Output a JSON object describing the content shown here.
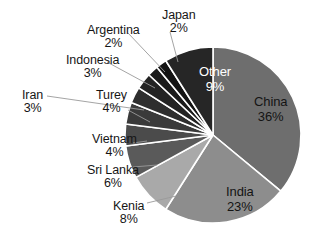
{
  "chart_data": {
    "type": "pie",
    "title": "",
    "subtitle": "",
    "xlabel": "",
    "ylabel": "",
    "legend_position": "none",
    "grid": false,
    "value_unit": "%",
    "total": 100,
    "start_angle_deg": 0,
    "direction": "clockwise",
    "background_color": "#ffffff",
    "categories": [
      "China",
      "India",
      "Kenia",
      "Sri Lanka",
      "Vietnam",
      "Turey",
      "Iran",
      "Indonesia",
      "Argentina",
      "Japan",
      "Other"
    ],
    "values": [
      36,
      23,
      8,
      6,
      4,
      4,
      3,
      3,
      2,
      2,
      9
    ],
    "slices": [
      {
        "name": "China",
        "value": 36,
        "label": "China",
        "value_label": "36%",
        "color": "#6e6e6e",
        "label_placement": "inside",
        "label_text_color": "#141414",
        "label_x": 254,
        "label_y": 95
      },
      {
        "name": "India",
        "value": 23,
        "label": "India",
        "value_label": "23%",
        "color": "#8d8d8d",
        "label_placement": "inside",
        "label_text_color": "#141414",
        "label_x": 226,
        "label_y": 185
      },
      {
        "name": "Kenia",
        "value": 8,
        "label": "Kenia",
        "value_label": "8%",
        "color": "#a9a9a9",
        "label_placement": "outside",
        "label_text_color": "#161616",
        "label_x": 113,
        "label_y": 200,
        "leader": [
          [
            147,
            203
          ],
          [
            176,
            196
          ]
        ]
      },
      {
        "name": "Sri Lanka",
        "value": 6,
        "label": "Sri Lanka",
        "value_label": "6%",
        "color": "#5a5a5a",
        "label_placement": "outside",
        "label_text_color": "#161616",
        "label_x": 87,
        "label_y": 164,
        "leader": [
          [
            133,
            167
          ],
          [
            157,
            165
          ]
        ]
      },
      {
        "name": "Vietnam",
        "value": 4,
        "label": "Vietnam",
        "value_label": "4%",
        "color": "#4b4b4b",
        "label_placement": "outside",
        "label_text_color": "#161616",
        "label_x": 92,
        "label_y": 133,
        "leader": [
          [
            133,
            143
          ],
          [
            147,
            141
          ]
        ]
      },
      {
        "name": "Turey",
        "value": 4,
        "label": "Turey",
        "value_label": "4%",
        "color": "#3a3a3a",
        "label_placement": "outside",
        "label_text_color": "#161616",
        "label_x": 96,
        "label_y": 89,
        "leader": [
          [
            128,
            110
          ],
          [
            150,
            122
          ]
        ]
      },
      {
        "name": "Iran",
        "value": 3,
        "label": "Iran",
        "value_label": "3%",
        "color": "#2e2e2e",
        "label_placement": "outside",
        "label_text_color": "#161616",
        "label_x": 22,
        "label_y": 89,
        "leader": [
          [
            47,
            96
          ],
          [
            144,
            110
          ]
        ]
      },
      {
        "name": "Indonesia",
        "value": 3,
        "label": "Indonesia",
        "value_label": "3%",
        "color": "#232323",
        "label_placement": "outside",
        "label_text_color": "#161616",
        "label_x": 66,
        "label_y": 54,
        "leader": [
          [
            107,
            62
          ],
          [
            155,
            88
          ]
        ]
      },
      {
        "name": "Argentina",
        "value": 2,
        "label": "Argentina",
        "value_label": "2%",
        "color": "#1b1b1b",
        "label_placement": "outside",
        "label_text_color": "#161616",
        "label_x": 87,
        "label_y": 24,
        "leader": [
          [
            128,
            33
          ],
          [
            165,
            72
          ]
        ]
      },
      {
        "name": "Japan",
        "value": 2,
        "label": "Japan",
        "value_label": "2%",
        "color": "#141414",
        "label_placement": "outside",
        "label_text_color": "#161616",
        "label_x": 162,
        "label_y": 9,
        "leader": [
          [
            170,
            32
          ],
          [
            178,
            62
          ]
        ]
      },
      {
        "name": "Other",
        "value": 9,
        "label": "Other",
        "value_label": "9%",
        "color": "#262626",
        "label_placement": "inside",
        "label_text_color": "#ffffff",
        "label_x": 199,
        "label_y": 65
      }
    ],
    "geometry": {
      "center_x": 213,
      "center_y": 135,
      "radius": 88,
      "slice_border_color": "#ffffff",
      "slice_border_width": 1.6,
      "leader_line_color": "#9a9a9a",
      "leader_line_width": 0.9
    }
  }
}
